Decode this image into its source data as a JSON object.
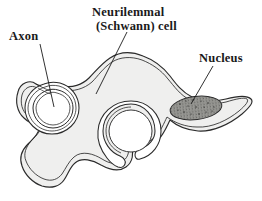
{
  "figure": {
    "title": "Neurilemmal (Schwann) cell",
    "background_color": "#ffffff",
    "width": 262,
    "height": 201
  },
  "labels": {
    "axon": "Axon",
    "schwann_line1": "Neurilemmal",
    "schwann_line2": "(Schwann) cell",
    "nucleus": "Nucleus"
  },
  "structures": {
    "cell_body": {
      "name": "Neurilemmal (Schwann) cell cytoplasm",
      "fill_color": "#efefee",
      "stroke_color": "#2b2b2b"
    },
    "axon_upper_left": {
      "name": "Axon enveloped by mesaxon",
      "fill_color": "#ffffff",
      "stroke_color": "#2b2b2b"
    },
    "axon_lower_middle": {
      "name": "Axon enveloped by mesaxon",
      "fill_color": "#ffffff",
      "stroke_color": "#2b2b2b"
    },
    "nucleus": {
      "name": "Nucleus",
      "fill_color": "#9a9a96",
      "stroke_color": "#2b2b2b",
      "texture": "stippled"
    }
  },
  "leader_lines": {
    "axon": {
      "x1": 40,
      "y1": 44,
      "x2": 54,
      "y2": 107
    },
    "schwann": {
      "x1": 127,
      "y1": 32,
      "x2": 96,
      "y2": 94
    },
    "nucleus": {
      "x1": 213,
      "y1": 66,
      "x2": 191,
      "y2": 104
    }
  }
}
